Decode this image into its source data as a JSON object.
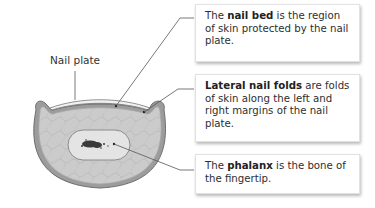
{
  "diagram": {
    "labels": {
      "nail_plate": "Nail plate"
    },
    "callouts": [
      {
        "id": "nail-bed",
        "prefix": "The ",
        "term": "nail bed",
        "suffix": " is the region of skin protected by the nail plate."
      },
      {
        "id": "lateral-nail-folds",
        "prefix": "",
        "term": "Lateral nail folds",
        "suffix": " are folds of skin along the left and right margins of the nail plate."
      },
      {
        "id": "phalanx",
        "prefix": "The ",
        "term": "phalanx",
        "suffix": " is the bone of the fingertip."
      }
    ],
    "colors": {
      "tissue": "#c9c9c9",
      "skin_edge": "#8a8a8a",
      "nail_plate": "#f1f1f1",
      "bone": "#e2e2e2",
      "marrow": "#3a3a3a",
      "leader": "#555555"
    }
  }
}
